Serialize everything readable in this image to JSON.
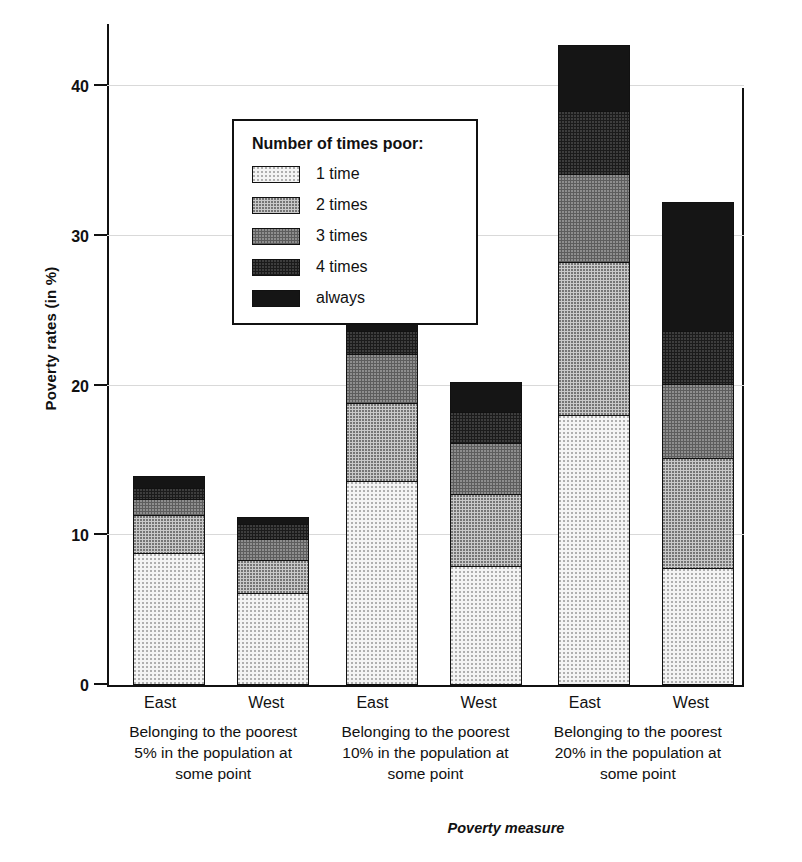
{
  "chart_data": {
    "type": "bar",
    "subtype": "stacked-bar-grouped",
    "title": "",
    "xlabel": "Poverty measure",
    "ylabel": "Poverty rates (in %)",
    "ylim": [
      0,
      40
    ],
    "yticks": [
      0,
      10,
      20,
      30,
      40
    ],
    "ytick_labels": [
      "0",
      "10",
      "20",
      "30",
      "40"
    ],
    "grid": true,
    "grid_axis": "y",
    "legend_title": "Number of times poor:",
    "legend_position": "upper-left-inside",
    "series": [
      {
        "name": "1 time",
        "key": "t1",
        "fill": "light-dotted",
        "color": "#f4f4f4"
      },
      {
        "name": "2 times",
        "key": "t2",
        "fill": "medium-dotted",
        "color": "#c9c9c9"
      },
      {
        "name": "3 times",
        "key": "t3",
        "fill": "dark-dotted",
        "color": "#5d5d5d"
      },
      {
        "name": "4 times",
        "key": "t4",
        "fill": "near-black",
        "color": "#1b1b1b"
      },
      {
        "name": "always",
        "key": "t5",
        "fill": "black",
        "color": "#151515"
      }
    ],
    "groups": [
      {
        "caption": "Belonging to the poorest 5% in the population at some point",
        "caption_lines": [
          "Belonging to the poorest",
          "5% in the population at",
          "some point"
        ],
        "bars": [
          {
            "label": "East",
            "total": 13.8,
            "values": {
              "t1": 8.7,
              "t2": 2.5,
              "t3": 1.1,
              "t4": 0.7,
              "t5": 0.8
            }
          },
          {
            "label": "West",
            "total": 11.1,
            "values": {
              "t1": 6.0,
              "t2": 2.2,
              "t3": 1.4,
              "t4": 1.0,
              "t5": 0.5
            }
          }
        ]
      },
      {
        "caption": "Belonging to the poorest 10% in the population at some point",
        "caption_lines": [
          "Belonging to the poorest",
          "10% in the population at",
          "some point"
        ],
        "bars": [
          {
            "label": "East",
            "total": 24.6,
            "values": {
              "t1": 13.5,
              "t2": 5.2,
              "t3": 3.3,
              "t4": 1.5,
              "t5": 1.1
            }
          },
          {
            "label": "West",
            "total": 20.1,
            "values": {
              "t1": 7.8,
              "t2": 4.8,
              "t3": 3.4,
              "t4": 2.1,
              "t5": 2.0
            }
          }
        ]
      },
      {
        "caption": "Belonging to the poorest 20% in the population at some point",
        "caption_lines": [
          "Belonging to the poorest",
          "20% in the population at",
          "some point"
        ],
        "bars": [
          {
            "label": "East",
            "total": 42.6,
            "values": {
              "t1": 17.9,
              "t2": 10.2,
              "t3": 5.9,
              "t4": 4.2,
              "t5": 4.4
            }
          },
          {
            "label": "West",
            "total": 32.1,
            "values": {
              "t1": 7.7,
              "t2": 7.3,
              "t3": 5.0,
              "t4": 3.5,
              "t5": 8.6
            }
          }
        ]
      }
    ]
  }
}
